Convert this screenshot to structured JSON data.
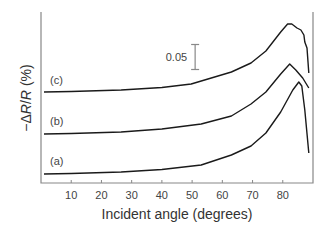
{
  "chart_data": {
    "type": "line",
    "title": "",
    "xlabel": "Incident angle (degrees)",
    "ylabel_parts": [
      "−Δ",
      "R",
      "/",
      "R",
      " (%)"
    ],
    "ylabel": "−ΔR/R (%)",
    "xlim": [
      0,
      90
    ],
    "ylim": [
      0,
      0.342
    ],
    "x_ticks": [
      10,
      20,
      30,
      40,
      50,
      60,
      70,
      80
    ],
    "y_ticks": [],
    "grid": false,
    "legend": "none (curves labelled inline)",
    "scale_bar": {
      "label": "0.05",
      "value": 0.05,
      "x": 51,
      "y_center": 0.252
    },
    "series": [
      {
        "name": "(a)",
        "label_pos": [
          3,
          0.036
        ],
        "points": [
          [
            1,
            0.018
          ],
          [
            10,
            0.019
          ],
          [
            26.5,
            0.022
          ],
          [
            40,
            0.027
          ],
          [
            53,
            0.036
          ],
          [
            63,
            0.056
          ],
          [
            69.5,
            0.074
          ],
          [
            74.4,
            0.1
          ],
          [
            79.3,
            0.142
          ],
          [
            83.3,
            0.186
          ],
          [
            85.3,
            0.202
          ],
          [
            86.3,
            0.194
          ],
          [
            87.3,
            0.146
          ],
          [
            88.6,
            0.06
          ]
        ]
      },
      {
        "name": "(b)",
        "label_pos": [
          3,
          0.116
        ],
        "points": [
          [
            1,
            0.098
          ],
          [
            10,
            0.099
          ],
          [
            26.5,
            0.102
          ],
          [
            40,
            0.108
          ],
          [
            53,
            0.118
          ],
          [
            63,
            0.134
          ],
          [
            69.5,
            0.158
          ],
          [
            74.4,
            0.182
          ],
          [
            79.3,
            0.218
          ],
          [
            82.3,
            0.238
          ],
          [
            84.3,
            0.226
          ],
          [
            86.6,
            0.21
          ],
          [
            88.6,
            0.19
          ]
        ]
      },
      {
        "name": "(c)",
        "label_pos": [
          3,
          0.198
        ],
        "points": [
          [
            1,
            0.182
          ],
          [
            10,
            0.183
          ],
          [
            26.5,
            0.186
          ],
          [
            40,
            0.191
          ],
          [
            49.7,
            0.198
          ],
          [
            63,
            0.222
          ],
          [
            69.5,
            0.24
          ],
          [
            74.4,
            0.264
          ],
          [
            79.3,
            0.302
          ],
          [
            81.6,
            0.318
          ],
          [
            83,
            0.318
          ],
          [
            84.7,
            0.31
          ],
          [
            86,
            0.306
          ],
          [
            87,
            0.296
          ],
          [
            87.3,
            0.282
          ],
          [
            88,
            0.27
          ],
          [
            88.6,
            0.22
          ]
        ]
      }
    ]
  },
  "colors": {
    "curve": "#1a1a1a",
    "axis": "#888888",
    "text": "#444444"
  }
}
